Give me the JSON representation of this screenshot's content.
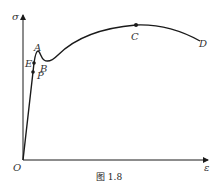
{
  "figure": {
    "caption": "图 1.8",
    "axes": {
      "y_label": "σ",
      "x_label": "ε",
      "origin_label": "O"
    },
    "points": {
      "A": "A",
      "B": "B",
      "C": "C",
      "D": "D",
      "E": "E",
      "P": "P"
    },
    "colors": {
      "line": "#1a1a1a",
      "text": "#333333"
    }
  }
}
